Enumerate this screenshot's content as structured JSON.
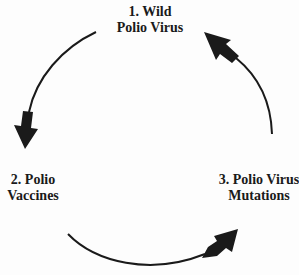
{
  "diagram": {
    "type": "cycle",
    "direction": "counter-clockwise",
    "colors": {
      "background": "#fdfdfd",
      "arrow": "#1a1a1a",
      "text": "#1a1a1a"
    },
    "nodes": [
      {
        "id": 1,
        "line1": "1. Wild",
        "line2": "Polio Virus"
      },
      {
        "id": 2,
        "line1": "2. Polio",
        "line2": "Vaccines"
      },
      {
        "id": 3,
        "line1": "3. Polio Virus",
        "line2": "Mutations"
      }
    ],
    "edges": [
      {
        "from": 1,
        "to": 2
      },
      {
        "from": 2,
        "to": 3
      },
      {
        "from": 3,
        "to": 1
      }
    ]
  }
}
